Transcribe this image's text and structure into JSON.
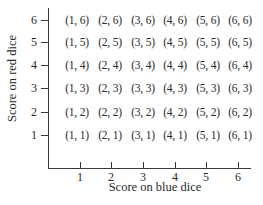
{
  "chart_data": {
    "type": "table",
    "title": "",
    "xlabel": "Score on blue dice",
    "ylabel": "Score on red dice",
    "x_ticks": [
      "1",
      "2",
      "3",
      "4",
      "5",
      "6"
    ],
    "y_ticks": [
      "1",
      "2",
      "3",
      "4",
      "5",
      "6"
    ],
    "grid": false,
    "rows_top_to_bottom": [
      [
        "(1, 6)",
        "(2, 6)",
        "(3, 6)",
        "(4, 6)",
        "(5, 6)",
        "(6, 6)"
      ],
      [
        "(1, 5)",
        "(2, 5)",
        "(3, 5)",
        "(4, 5)",
        "(5, 5)",
        "(6, 5)"
      ],
      [
        "(1, 4)",
        "(2, 4)",
        "(3, 4)",
        "(4, 4)",
        "(5, 4)",
        "(6, 4)"
      ],
      [
        "(1, 3)",
        "(2, 3)",
        "(3, 3)",
        "(4, 3)",
        "(5, 3)",
        "(6, 3)"
      ],
      [
        "(1, 2)",
        "(2, 2)",
        "(3, 2)",
        "(4, 2)",
        "(5, 2)",
        "(6, 2)"
      ],
      [
        "(1, 1)",
        "(2, 1)",
        "(3, 1)",
        "(4, 1)",
        "(5, 1)",
        "(6, 1)"
      ]
    ]
  },
  "axes": {
    "x_title": "Score on blue dice",
    "y_title": "Score on red dice",
    "y_tick_labels_top_to_bottom": [
      "6",
      "5",
      "4",
      "3",
      "2",
      "1"
    ],
    "x_tick_labels": [
      "1",
      "2",
      "3",
      "4",
      "5",
      "6"
    ]
  },
  "grid": {
    "rows": [
      [
        "(1, 6)",
        "(2, 6)",
        "(3, 6)",
        "(4, 6)",
        "(5, 6)",
        "(6, 6)"
      ],
      [
        "(1, 5)",
        "(2, 5)",
        "(3, 5)",
        "(4, 5)",
        "(5, 5)",
        "(6, 5)"
      ],
      [
        "(1, 4)",
        "(2, 4)",
        "(3, 4)",
        "(4, 4)",
        "(5, 4)",
        "(6, 4)"
      ],
      [
        "(1, 3)",
        "(2, 3)",
        "(3, 3)",
        "(4, 3)",
        "(5, 3)",
        "(6, 3)"
      ],
      [
        "(1, 2)",
        "(2, 2)",
        "(3, 2)",
        "(4, 2)",
        "(5, 2)",
        "(6, 2)"
      ],
      [
        "(1, 1)",
        "(2, 1)",
        "(3, 1)",
        "(4, 1)",
        "(5, 1)",
        "(6, 1)"
      ]
    ]
  }
}
